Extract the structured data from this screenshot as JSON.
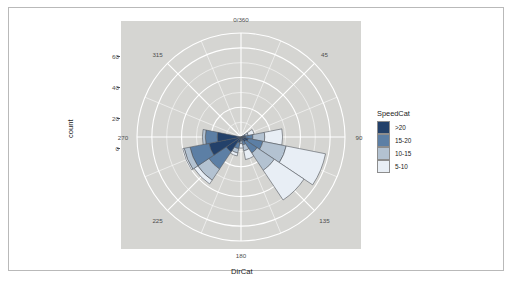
{
  "figure": {
    "axis_titles": {
      "x": "DirCat",
      "y": "count"
    },
    "panel_background": "#d5d5d2",
    "grid_color": "#ffffff",
    "plot_background": "#ffffff"
  },
  "legend": {
    "title": "SpeedCat",
    "position": "right",
    "items": [
      {
        "label": ">20",
        "color": "#23416a"
      },
      {
        "label": "15-20",
        "color": "#5c7fa5"
      },
      {
        "label": "10-15",
        "color": "#b3c2d1"
      },
      {
        "label": "5-10",
        "color": "#e8eef5"
      }
    ]
  },
  "chart_data": {
    "type": "bar",
    "subtype": "wind-rose-polar-stacked",
    "title": "",
    "xlabel": "DirCat",
    "ylabel": "count",
    "ylim": [
      0,
      70
    ],
    "grid": true,
    "legend_position": "right",
    "angular_axis": {
      "unit": "degrees",
      "zero_at": "north",
      "direction": "clockwise",
      "tick_labels": [
        "0/360",
        "45",
        "90",
        "135",
        "180",
        "225",
        "270",
        "315"
      ],
      "tick_values": [
        0,
        45,
        90,
        135,
        180,
        225,
        270,
        315
      ],
      "minor_gridline_count": 16
    },
    "radial_axis": {
      "tick_labels": [
        "0",
        "20",
        "40",
        "60"
      ],
      "tick_values": [
        0,
        20,
        40,
        60
      ],
      "max": 70
    },
    "categories": [
      0,
      22.5,
      45,
      67.5,
      90,
      112.5,
      135,
      157.5,
      180,
      202.5,
      225,
      247.5,
      270,
      292.5,
      315,
      337.5
    ],
    "series": [
      {
        "name": ">20",
        "color": "#23416a",
        "values": [
          0,
          0,
          0,
          1.5,
          3,
          5,
          4,
          2.5,
          1,
          4,
          12,
          22,
          16,
          0,
          0,
          0
        ]
      },
      {
        "name": "15-20",
        "color": "#5c7fa5",
        "values": [
          0,
          0,
          0,
          1.5,
          5,
          10,
          9,
          3,
          1.5,
          4,
          14,
          13,
          8,
          0,
          0,
          0
        ]
      },
      {
        "name": "10-15",
        "color": "#b3c2d1",
        "values": [
          0,
          0,
          0,
          2,
          8,
          16,
          14,
          4,
          2,
          3,
          9,
          4,
          2,
          0,
          0,
          0
        ]
      },
      {
        "name": "5-10",
        "color": "#e8eef5",
        "values": [
          0,
          0,
          0,
          4,
          12,
          27,
          24,
          6,
          3,
          2,
          3,
          1,
          0,
          0,
          0,
          0
        ]
      }
    ],
    "totals": [
      0,
      0,
      0,
      9,
      28,
      58,
      51,
      15.5,
      7.5,
      13,
      38,
      40,
      26,
      0,
      0,
      0
    ]
  }
}
